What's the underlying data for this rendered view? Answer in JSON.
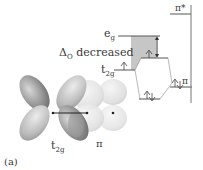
{
  "figure": {
    "panel_label": "(a)",
    "energy_diagram": {
      "levels": {
        "eg": {
          "label_main": "e",
          "label_sub": "g"
        },
        "t2g_upper": {
          "label_main": "t",
          "label_sub": "2g"
        },
        "pi_star": {
          "label": "π*"
        },
        "pi_right": {
          "label": "π"
        }
      },
      "delta_label_symbol": "Δ",
      "delta_label_sub": "O",
      "delta_label_text": " decreased"
    },
    "orbital_picture": {
      "metal_orbital_label_main": "t",
      "metal_orbital_label_sub": "2g",
      "ligand_orbital_label": "π"
    },
    "colors": {
      "shade": "#c8c8c8",
      "line": "#555555",
      "lobe_dark": "#8a8a8a",
      "lobe_light": "#e6e6e6"
    }
  }
}
